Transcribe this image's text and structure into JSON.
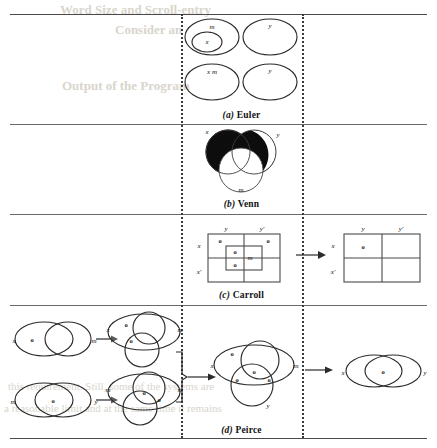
{
  "page": {
    "figure_kind": "comparison of logic diagram notations",
    "rows": [
      {
        "id": "euler",
        "caption_letter": "(a)",
        "caption_name": "Euler"
      },
      {
        "id": "venn",
        "caption_letter": "(b)",
        "caption_name": "Venn"
      },
      {
        "id": "carroll",
        "caption_letter": "(c)",
        "caption_name": "Carroll"
      },
      {
        "id": "peirce",
        "caption_letter": "(d)",
        "caption_name": "Peirce"
      }
    ]
  },
  "euler": {
    "diagrams": [
      {
        "id": "top-left",
        "outer_label": "m",
        "inner_label": "x"
      },
      {
        "id": "top-right",
        "outer_label": "y",
        "inner_label": ""
      },
      {
        "id": "bottom-left",
        "outer_label": "x m",
        "inner_label": ""
      },
      {
        "id": "bottom-right",
        "outer_label": "y",
        "inner_label": ""
      }
    ]
  },
  "venn": {
    "circle_labels": {
      "left": "x",
      "right": "y",
      "bottom": "m"
    },
    "shading": "x-region and x∩y outer lune filled solid black"
  },
  "carroll": {
    "left_diagram": {
      "col_labels": [
        "y",
        "y'"
      ],
      "row_labels": [
        "x",
        "x'"
      ],
      "inner_center_label": "m",
      "marks": [
        {
          "cell": "outer-top-left",
          "value": "o"
        },
        {
          "cell": "outer-top-right",
          "value": "o"
        },
        {
          "cell": "inner-top-left",
          "value": "o"
        },
        {
          "cell": "inner-bottom-left",
          "value": "o"
        }
      ]
    },
    "arrow": "→",
    "right_diagram": {
      "col_labels": [
        "y",
        "y'"
      ],
      "row_labels": [
        "x",
        "x'"
      ],
      "marks": [
        {
          "cell": "top-left",
          "value": "o"
        }
      ]
    }
  },
  "peirce": {
    "premise_1": {
      "labels": {
        "left": "x",
        "right": "m"
      },
      "marks": [
        {
          "region": "x-only",
          "value": "o"
        }
      ]
    },
    "premise_1_expanded": {
      "labels": {
        "left": "x",
        "right": "m"
      },
      "marks": [
        {
          "region": "x-only",
          "value": "o"
        },
        {
          "region": "x-lower",
          "value": "o"
        }
      ]
    },
    "premise_2": {
      "labels": {
        "left": "m",
        "right": "y"
      },
      "marks": [
        {
          "region": "m-and-y",
          "value": "o"
        }
      ]
    },
    "premise_2_expanded": {
      "labels": {
        "left": "m",
        "right": "m"
      },
      "marks": [
        {
          "region": "center-upper",
          "value": "o"
        },
        {
          "region": "center-right",
          "value": "o"
        }
      ]
    },
    "combined": {
      "labels": {
        "left": "x",
        "right": "m",
        "bottom": "y"
      },
      "marks": [
        {
          "region": "x-only",
          "value": "o"
        },
        {
          "region": "center",
          "value": "o"
        },
        {
          "region": "left-lower",
          "value": "o"
        },
        {
          "region": "right-lower",
          "value": "o"
        }
      ]
    },
    "conclusion": {
      "labels": {
        "left": "x",
        "right": "y"
      },
      "marks": [
        {
          "region": "intersection",
          "value": "o"
        }
      ]
    },
    "arrows": [
      "→",
      "→",
      "→",
      "→"
    ]
  },
  "bleed_text": [
    "Word Size and Scroll-entry",
    "Consider an",
    "Output of the Program",
    "this requirement. Still, some of the systems are",
    "a reasonable limit and at the same time it remains"
  ]
}
